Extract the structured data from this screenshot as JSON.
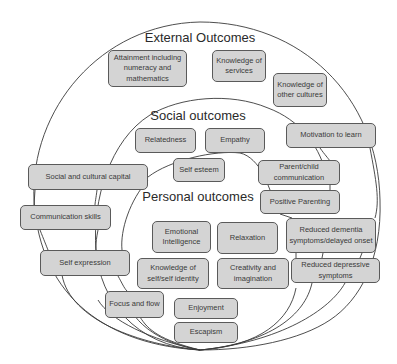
{
  "diagram": {
    "zones": [
      {
        "id": "external",
        "title": "External Outcomes"
      },
      {
        "id": "social",
        "title": "Social outcomes"
      },
      {
        "id": "personal",
        "title": "Personal outcomes"
      }
    ],
    "boxes": [
      {
        "label": "Attainment including numeracy and mathematics",
        "zone": "external"
      },
      {
        "label": "Knowledge of services",
        "zone": "external"
      },
      {
        "label": "Knowledge of other cultures",
        "zone": "external"
      },
      {
        "label": "Motivation to learn",
        "zone": "external"
      },
      {
        "label": "Social and cultural capital",
        "zone": "external/social"
      },
      {
        "label": "Communication skills",
        "zone": "external/social"
      },
      {
        "label": "Self expression",
        "zone": "external/social/personal"
      },
      {
        "label": "Relatedness",
        "zone": "social"
      },
      {
        "label": "Empathy",
        "zone": "social"
      },
      {
        "label": "Self esteem",
        "zone": "social/personal"
      },
      {
        "label": "Parent/child communication",
        "zone": "social/personal"
      },
      {
        "label": "Positive Parenting",
        "zone": "social"
      },
      {
        "label": "Emotional Intelligence",
        "zone": "personal"
      },
      {
        "label": "Relaxation",
        "zone": "personal"
      },
      {
        "label": "Reduced dementia symptoms/delayed onset",
        "zone": "external/social"
      },
      {
        "label": "Knowledge of self/self identity",
        "zone": "personal"
      },
      {
        "label": "Creativity and imagination",
        "zone": "personal"
      },
      {
        "label": "Reduced depressive symptoms",
        "zone": "external/social"
      },
      {
        "label": "Focus and flow",
        "zone": "personal/social"
      },
      {
        "label": "Enjoyment",
        "zone": "personal"
      },
      {
        "label": "Escapism",
        "zone": "personal"
      }
    ],
    "colors": {
      "box_fill": "#d4d4d4",
      "box_border": "#5a5a5a",
      "line": "#3a3a3a",
      "text": "#2a2a2a"
    }
  }
}
